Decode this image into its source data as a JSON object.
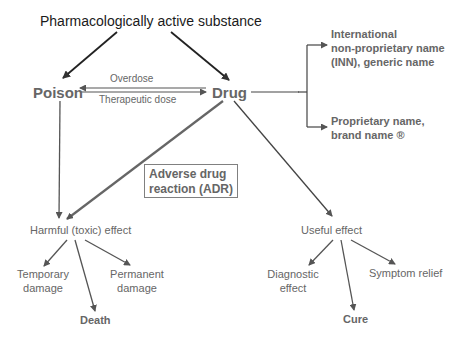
{
  "diagram": {
    "root": "Pharmacologically active substance",
    "poison": "Poison",
    "drug": "Drug",
    "edge_overdose": "Overdose",
    "edge_therapeutic": "Therapeutic dose",
    "inn_line1": "International",
    "inn_line2": "non-proprietary name",
    "inn_line3": "(INN), generic name",
    "brand_line1": "Proprietary name,",
    "brand_line2": "brand name ®",
    "adr_line1": "Adverse drug",
    "adr_line2": "reaction (ADR)",
    "harmful": "Harmful (toxic) effect",
    "temporary_line1": "Temporary",
    "temporary_line2": "damage",
    "permanent_line1": "Permanent",
    "permanent_line2": "damage",
    "death": "Death",
    "useful": "Useful effect",
    "diagnostic_line1": "Diagnostic",
    "diagnostic_line2": "effect",
    "symptom": "Symptom relief",
    "cure": "Cure"
  },
  "colors": {
    "text_dark": "#1a1a1a",
    "text_grey": "#666666",
    "line": "#444444",
    "box_border": "#808080"
  }
}
